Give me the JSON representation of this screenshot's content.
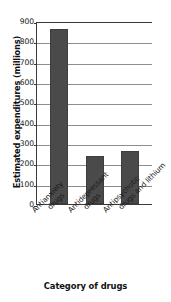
{
  "chart_data": {
    "type": "bar",
    "title": "",
    "xlabel": "Category of drugs",
    "ylabel": "Estimated expenditures (millions)",
    "categories": [
      "Antianxiety drugs",
      "Antidepressant drugs",
      "Antipsychotic drugs and lithium"
    ],
    "category_lines": [
      [
        "Antianxiety",
        "drugs"
      ],
      [
        "Antidepressant",
        "drugs"
      ],
      [
        "Antipsychotic",
        "drugs and lithium"
      ]
    ],
    "values": [
      860,
      238,
      263
    ],
    "ylim": [
      0,
      900
    ],
    "ytick_labels": [
      "900",
      "800",
      "700",
      "600",
      "500",
      "400",
      "300",
      "200",
      "100",
      "0"
    ],
    "ytick_values": [
      900,
      800,
      700,
      600,
      500,
      400,
      300,
      200,
      100,
      0
    ],
    "grid": true,
    "legend": false,
    "bar_color": "#4a4a4a",
    "grid_color": "#8d8d8d",
    "axis_color": "#3a3a3a",
    "background_color": "#ffffff"
  }
}
